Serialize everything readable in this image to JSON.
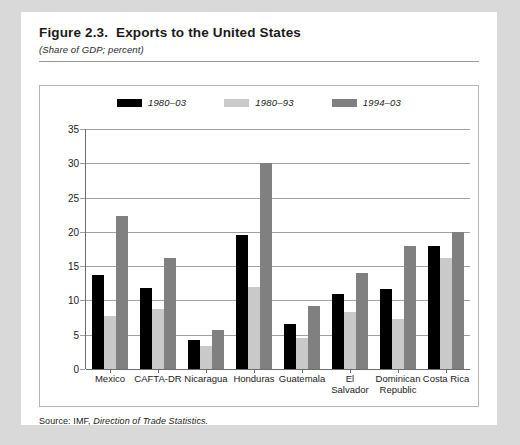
{
  "figure": {
    "title": "Figure 2.3.  Exports to the United States",
    "subtitle": "(Share of GDP; percent)",
    "source_prefix": "Source: IMF,",
    "source_italic": "Direction of Trade Statistics."
  },
  "colors": {
    "series_1980_03": "#000000",
    "series_1980_93": "#c9c9c9",
    "series_1994_03": "#808080",
    "panel_background": "#ffffff",
    "page_background": "#d9d9d9",
    "gridline": "#9e9e9e",
    "frame_border": "#b5b5b5",
    "header_rule": "#9a9a9a"
  },
  "chart_data": {
    "type": "bar",
    "title": "Figure 2.3.  Exports to the United States",
    "subtitle": "(Share of GDP; percent)",
    "xlabel": "",
    "ylabel": "",
    "ylim": [
      0,
      35
    ],
    "yticks": [
      0,
      5,
      10,
      15,
      20,
      25,
      30,
      35
    ],
    "ytick_labels": [
      "0",
      "5",
      "10",
      "15",
      "20",
      "25",
      "30",
      "35"
    ],
    "grid": true,
    "legend_position": "top-center",
    "categories": [
      "Mexico",
      "CAFTA-DR",
      "Nicaragua",
      "Honduras",
      "Guatemala",
      "El Salvador",
      "Dominican\nRepublic",
      "Costa Rica"
    ],
    "series": [
      {
        "name": "1980–03",
        "color": "#000000",
        "values": [
          13.7,
          11.8,
          4.3,
          19.6,
          6.5,
          11.0,
          11.7,
          18.0
        ]
      },
      {
        "name": "1980–93",
        "color": "#c9c9c9",
        "values": [
          7.7,
          8.8,
          3.4,
          12.0,
          4.5,
          8.3,
          7.3,
          16.2
        ]
      },
      {
        "name": "1994–03",
        "color": "#808080",
        "values": [
          22.3,
          16.2,
          5.7,
          30.0,
          9.2,
          14.0,
          17.9,
          20.0
        ]
      }
    ],
    "source": "Source: IMF, Direction of Trade Statistics."
  }
}
